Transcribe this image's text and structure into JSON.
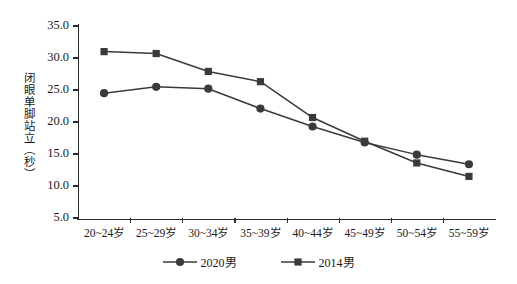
{
  "chart_data": {
    "type": "line",
    "title": "",
    "xlabel": "",
    "ylabel": "闭眼单脚站立（秒）",
    "categories": [
      "20~24岁",
      "25~29岁",
      "30~34岁",
      "35~39岁",
      "40~44岁",
      "45~49岁",
      "50~54岁",
      "55~59岁"
    ],
    "series": [
      {
        "name": "2020男",
        "marker": "circle",
        "color": "#3a3a3a",
        "values": [
          24.5,
          25.5,
          25.2,
          22.1,
          19.3,
          16.8,
          14.9,
          13.4
        ]
      },
      {
        "name": "2014男",
        "marker": "square",
        "color": "#3a3a3a",
        "values": [
          31.0,
          30.7,
          27.9,
          26.3,
          20.7,
          17.0,
          13.6,
          11.5
        ]
      }
    ],
    "ylim": [
      5.0,
      35.0
    ],
    "yticks": [
      35.0,
      30.0,
      25.0,
      20.0,
      15.0,
      10.0,
      5.0
    ],
    "ytick_labels": [
      "35.0",
      "30.0",
      "25.0",
      "20.0",
      "15.0",
      "10.0",
      "5.0"
    ],
    "grid": false,
    "legend_position": "bottom"
  },
  "legend": {
    "items": [
      {
        "label": "2020男",
        "marker": "circle"
      },
      {
        "label": "2014男",
        "marker": "square"
      }
    ]
  }
}
